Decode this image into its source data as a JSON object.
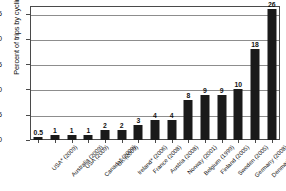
{
  "chart_data": {
    "type": "bar",
    "title": "",
    "subtitle": "",
    "xlabel": "",
    "ylabel": "Percent of trips by cycling",
    "ylim": [
      0,
      26.5
    ],
    "yticks": [
      0,
      5,
      10,
      15,
      20,
      25
    ],
    "grid": "horizontal",
    "legend": "none",
    "orientation": "vertical",
    "bar_color": "#1a1a1a",
    "categories": [
      "USA* (2009)",
      "Australia (2009)",
      "USA (2009)",
      "Canada* (2009)",
      "UK (2009)",
      "Ireland* (2006)",
      "France (2008)",
      "Austria (2008)",
      "Norway (2001)",
      "Belgium (1999)",
      "Finland (2005)",
      "Sweden (2005)",
      "Germany (2008)",
      "Denmark (2008)",
      "Netherlands (2008)"
    ],
    "values": [
      0.5,
      1,
      1,
      1,
      2,
      2,
      3,
      4,
      4,
      8,
      9,
      9,
      10,
      18,
      26
    ],
    "value_labels": [
      "0.5",
      "1",
      "1",
      "1",
      "2",
      "2",
      "3",
      "4",
      "4",
      "8",
      "9",
      "9",
      "10",
      "18",
      "26"
    ]
  }
}
